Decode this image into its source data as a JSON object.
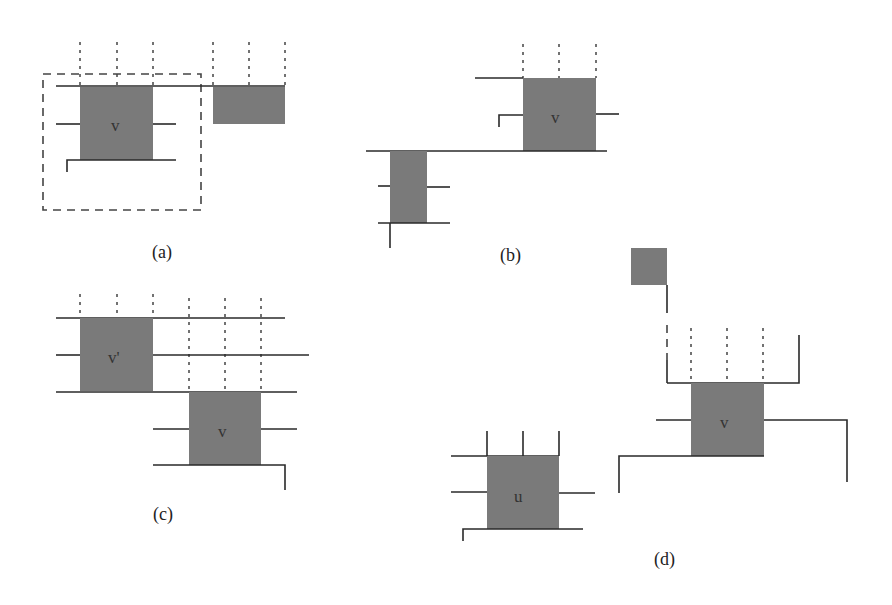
{
  "figure": {
    "panels": [
      {
        "id": "a",
        "caption": "(a)",
        "node_labels": [
          "v"
        ]
      },
      {
        "id": "b",
        "caption": "(b)",
        "node_labels": [
          "v"
        ]
      },
      {
        "id": "c",
        "caption": "(c)",
        "node_labels": [
          "v'",
          "v"
        ]
      },
      {
        "id": "d",
        "caption": "(d)",
        "node_labels": [
          "v",
          "u"
        ]
      }
    ]
  },
  "colors": {
    "node_fill": "#7a7a7a",
    "wire": "#2a2a2a",
    "background": "#ffffff"
  }
}
